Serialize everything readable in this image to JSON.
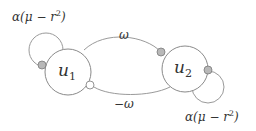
{
  "diagram": {
    "nodes": [
      {
        "id": "u1",
        "label": "u",
        "sub": "1"
      },
      {
        "id": "u2",
        "label": "u",
        "sub": "2"
      }
    ],
    "edges": [
      {
        "from": "u1",
        "to": "u2",
        "label": "ω",
        "terminal": "gray-dot"
      },
      {
        "from": "u2",
        "to": "u1",
        "label": "−ω",
        "terminal": "white-dot"
      },
      {
        "from": "u1",
        "to": "u1",
        "label_main": "α(μ − r",
        "label_sup": "2",
        "label_end": ")",
        "terminal": "gray-dot"
      },
      {
        "from": "u2",
        "to": "u2",
        "label_main": "α(μ − r",
        "label_sup": "2",
        "label_end": ")",
        "terminal": "gray-dot"
      }
    ],
    "colors": {
      "stroke": "#8a8a8a",
      "gray_dot_fill": "#b8b8b8",
      "white_dot_fill": "#ffffff",
      "text": "#333333"
    }
  }
}
